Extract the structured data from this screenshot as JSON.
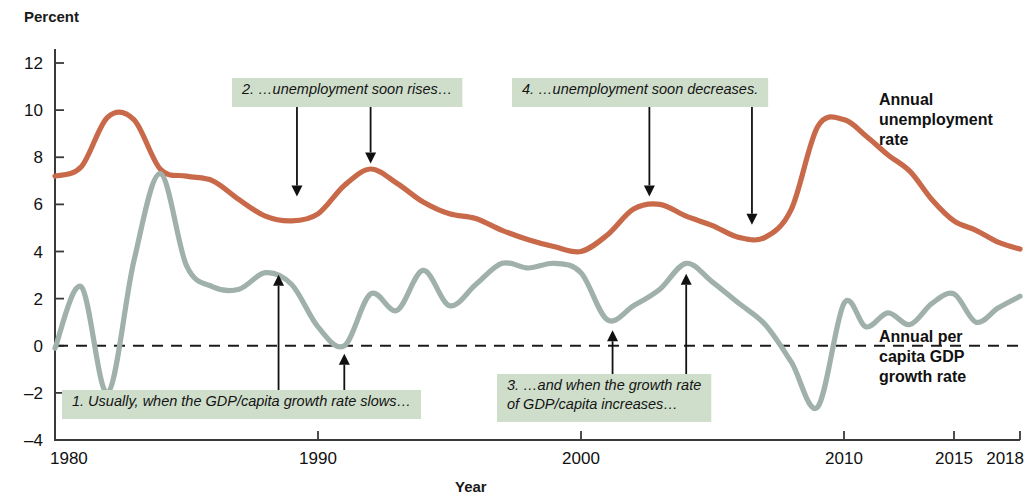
{
  "chart_data": {
    "type": "line",
    "title": "",
    "ylabel": "Percent",
    "xlabel": "Year",
    "ylim": [
      -4,
      12
    ],
    "xlim": [
      1980,
      2018
    ],
    "ytick_labels": [
      "12",
      "10",
      "8",
      "6",
      "4",
      "2",
      "0",
      "-2",
      "-4"
    ],
    "yticks": [
      12,
      10,
      8,
      6,
      4,
      2,
      0,
      -2,
      -4
    ],
    "xtick_labels": [
      "1980",
      "1990",
      "2000",
      "2010",
      "2015",
      "2018"
    ],
    "xticks": [
      1980,
      1990,
      2000,
      2010,
      2015,
      2018
    ],
    "grid": false,
    "legend_position": "right-inline",
    "zero_reference_line": 0,
    "colors": {
      "unemployment": "#c8694a",
      "gdp": "#9fb1aa",
      "annotation_box": "#cfdecb",
      "axis": "#3a3a3a",
      "text": "#111111"
    },
    "series": [
      {
        "name": "Annual unemployment rate",
        "color": "#c8694a",
        "x": [
          1980,
          1981,
          1982,
          1983,
          1984,
          1985,
          1986,
          1987,
          1988,
          1989,
          1990,
          1991,
          1992,
          1993,
          1994,
          1995,
          1996,
          1997,
          1998,
          1999,
          2000,
          2001,
          2002,
          2003,
          2004,
          2005,
          2006,
          2007,
          2008,
          2009,
          2010,
          2011,
          2012,
          2013,
          2014,
          2015,
          2016,
          2017,
          2018
        ],
        "values": [
          7.2,
          7.6,
          9.7,
          9.6,
          7.5,
          7.2,
          7.0,
          6.2,
          5.5,
          5.3,
          5.6,
          6.8,
          7.5,
          6.9,
          6.1,
          5.6,
          5.4,
          4.9,
          4.5,
          4.2,
          4.0,
          4.7,
          5.8,
          6.0,
          5.5,
          5.1,
          4.6,
          4.6,
          5.8,
          9.3,
          9.6,
          8.9,
          8.1,
          7.4,
          6.2,
          5.3,
          4.9,
          4.4,
          4.1
        ]
      },
      {
        "name": "Annual per capita GDP growth rate",
        "color": "#9fb1aa",
        "x": [
          1980,
          1981,
          1982,
          1983,
          1984,
          1985,
          1986,
          1987,
          1988,
          1989,
          1990,
          1991,
          1992,
          1993,
          1994,
          1995,
          1996,
          1997,
          1998,
          1999,
          2000,
          2001,
          2002,
          2003,
          2004,
          2005,
          2006,
          2007,
          2008,
          2009,
          2010,
          2011,
          2012,
          2013,
          2014,
          2015,
          2016,
          2017,
          2018
        ],
        "values": [
          -0.1,
          2.5,
          -2.0,
          3.6,
          7.3,
          3.4,
          2.5,
          2.4,
          3.1,
          2.6,
          0.8,
          0.0,
          2.2,
          1.5,
          3.2,
          1.7,
          2.6,
          3.5,
          3.3,
          3.5,
          3.1,
          1.1,
          1.7,
          2.4,
          3.5,
          2.7,
          1.8,
          0.9,
          -0.7,
          -2.6,
          1.8,
          0.8,
          1.4,
          0.9,
          1.8,
          2.2,
          1.0,
          1.6,
          2.1
        ]
      }
    ],
    "annotations": [
      {
        "id": "1",
        "lines": [
          "1. Usually, when the GDP/capita growth rate slows…"
        ],
        "arrow_direction": "up",
        "targets": [
          1988.5,
          1991.0
        ]
      },
      {
        "id": "2",
        "lines": [
          "2. …unemployment soon rises…"
        ],
        "arrow_direction": "down",
        "targets": [
          1989.2,
          1992.0
        ]
      },
      {
        "id": "3",
        "lines": [
          "3. …and when the growth rate",
          "of GDP/capita increases…"
        ],
        "arrow_direction": "up",
        "targets": [
          2001.2,
          2004.0
        ]
      },
      {
        "id": "4",
        "lines": [
          "4. …unemployment soon decreases."
        ],
        "arrow_direction": "down",
        "targets": [
          2002.6,
          2006.5
        ]
      }
    ],
    "series_labels": [
      {
        "text_lines": [
          "Annual",
          "unemployment",
          "rate"
        ]
      },
      {
        "text_lines": [
          "Annual per",
          "capita GDP",
          "growth rate"
        ]
      }
    ]
  },
  "axis": {
    "y_title": "Percent",
    "x_title": "Year"
  },
  "annotation_text": {
    "a1_l1": "1. Usually, when the GDP/capita growth rate slows…",
    "a2_l1": "2. …unemployment soon rises…",
    "a3_l1": "3. …and when the growth rate",
    "a3_l2": "of GDP/capita increases…",
    "a4_l1": "4. …unemployment soon decreases."
  },
  "series_label_text": {
    "u1": "Annual",
    "u2": "unemployment",
    "u3": "rate",
    "g1": "Annual per",
    "g2": "capita GDP",
    "g3": "growth rate"
  }
}
